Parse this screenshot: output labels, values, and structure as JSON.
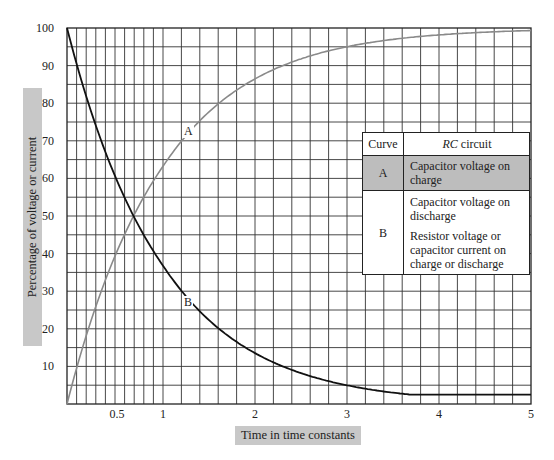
{
  "chart_data": {
    "type": "line",
    "title": "",
    "xlabel": "Time in time constants",
    "ylabel": "Percentage of voltage or current",
    "xlim": [
      0,
      5
    ],
    "ylim": [
      0,
      100
    ],
    "x_ticks": [
      "0.5",
      "1",
      "2",
      "3",
      "4",
      "5"
    ],
    "y_ticks": [
      "10",
      "20",
      "30",
      "40",
      "50",
      "60",
      "70",
      "80",
      "90",
      "100"
    ],
    "grid": true,
    "grid_notes": "vertical lines every 0.1 from 0 to 1, every 0.2 from 1 to 5; horizontal lines every 5%",
    "x": [
      0,
      0.25,
      0.5,
      0.69,
      1,
      1.5,
      2,
      2.5,
      3,
      3.5,
      4,
      4.5,
      5
    ],
    "series": [
      {
        "name": "A",
        "label": "A",
        "color": "#808080",
        "description": "Capacitor voltage on charge",
        "values": [
          0,
          22,
          39,
          50,
          63,
          78,
          86,
          92,
          95,
          97,
          98,
          99,
          99
        ]
      },
      {
        "name": "B",
        "label": "B",
        "color": "#111111",
        "description": "Capacitor voltage on discharge; Resistor voltage or capacitor current on charge or discharge",
        "values": [
          100,
          78,
          61,
          50,
          37,
          22,
          14,
          8,
          5,
          3,
          2,
          1,
          1
        ]
      }
    ],
    "legend": {
      "position": "right, inside plot",
      "header": [
        "Curve",
        "RC circuit"
      ],
      "rows": [
        {
          "curve": "A",
          "text": [
            "Capacitor voltage on charge"
          ]
        },
        {
          "curve": "B",
          "text": [
            "Capacitor voltage on discharge",
            "Resistor voltage or capacitor current on charge or discharge"
          ]
        }
      ]
    }
  },
  "axes": {
    "xlabel": "Time in time constants",
    "ylabel": "Percentage of voltage or current",
    "yticks": [
      {
        "label": "100",
        "v": 100
      },
      {
        "label": "90",
        "v": 90
      },
      {
        "label": "80",
        "v": 80
      },
      {
        "label": "70",
        "v": 70
      },
      {
        "label": "60",
        "v": 60
      },
      {
        "label": "50",
        "v": 50
      },
      {
        "label": "40",
        "v": 40
      },
      {
        "label": "30",
        "v": 30
      },
      {
        "label": "20",
        "v": 20
      },
      {
        "label": "10",
        "v": 10
      }
    ],
    "xticks": [
      {
        "label": "0.5",
        "v": 0.5
      },
      {
        "label": "1",
        "v": 1
      },
      {
        "label": "2",
        "v": 2
      },
      {
        "label": "3",
        "v": 3
      },
      {
        "label": "4",
        "v": 4
      },
      {
        "label": "5",
        "v": 5
      }
    ]
  },
  "curve_labels": {
    "a": "A",
    "b": "B"
  },
  "legend": {
    "header_curve": "Curve",
    "header_rc": "RC",
    "header_circuit": " circuit",
    "row_a_curve": "A",
    "row_a_text": "Capacitor voltage on charge",
    "row_b_curve": "B",
    "row_b_text_1": "Capacitor voltage on discharge",
    "row_b_text_2": "Resistor voltage or capacitor current on charge or discharge"
  },
  "colors": {
    "curve_a": "#8a8a8a",
    "curve_b": "#111111",
    "grid": "#333333",
    "label_bg": "#c8c8c8",
    "legend_row_a_bg": "#bdbdbd"
  }
}
